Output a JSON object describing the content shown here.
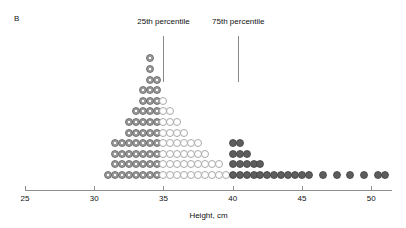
{
  "panel": {
    "label": "B"
  },
  "annotations": [
    {
      "name": "percentile-25",
      "label": "25th percentile",
      "value": 35.0
    },
    {
      "name": "percentile-75",
      "label": "75th percentile",
      "value": 40.4
    }
  ],
  "axis": {
    "title": "Height, cm",
    "ticks": [
      25,
      30,
      35,
      40,
      45,
      50
    ],
    "min": 25,
    "max": 51.5
  },
  "legend_styles": {
    "gray": "below-25th-percentile",
    "open": "interquartile-range",
    "dark": "above-75th-percentile"
  },
  "colors": {
    "axis": "#8d8d8d",
    "open_dot_border": "#a9a9a9",
    "gray_dot": "#9a9a9a",
    "dark_dot": "#5d5d5d",
    "text": "#111111"
  },
  "chart_data": {
    "type": "bar",
    "title": "",
    "xlabel": "Height, cm",
    "ylabel": "",
    "xlim": [
      25,
      51.5
    ],
    "grid": false,
    "legend_position": "none",
    "note": "Dot histogram: each dot is one observation; bins are 0.5 cm wide.",
    "bin_width": 0.5,
    "categories": [
      31.0,
      31.5,
      32.0,
      32.5,
      33.0,
      33.5,
      34.0,
      34.5,
      35.0,
      35.5,
      36.0,
      36.5,
      37.0,
      37.5,
      38.0,
      38.5,
      39.0,
      39.5,
      40.0,
      40.5,
      41.0,
      41.5,
      42.0,
      42.5,
      43.0,
      43.5,
      44.0,
      44.5,
      45.0,
      45.5,
      46.0,
      46.5,
      47.0,
      47.5,
      48.0,
      48.5,
      49.0,
      49.5,
      50.0,
      50.5,
      51.0
    ],
    "values": [
      1,
      4,
      4,
      6,
      7,
      9,
      12,
      10,
      8,
      7,
      6,
      5,
      4,
      4,
      3,
      2,
      2,
      1,
      4,
      4,
      3,
      2,
      2,
      1,
      1,
      1,
      1,
      1,
      1,
      1,
      0,
      1,
      0,
      1,
      0,
      1,
      0,
      1,
      0,
      1,
      1
    ],
    "styles": [
      "gray",
      "gray",
      "gray",
      "gray",
      "gray",
      "gray",
      "gray",
      "gray",
      "open",
      "open",
      "open",
      "open",
      "open",
      "open",
      "open",
      "open",
      "open",
      "open",
      "dark",
      "dark",
      "dark",
      "dark",
      "dark",
      "dark",
      "dark",
      "dark",
      "dark",
      "dark",
      "dark",
      "dark",
      "dark",
      "dark",
      "dark",
      "dark",
      "dark",
      "dark",
      "dark",
      "dark",
      "dark",
      "dark",
      "dark"
    ]
  }
}
